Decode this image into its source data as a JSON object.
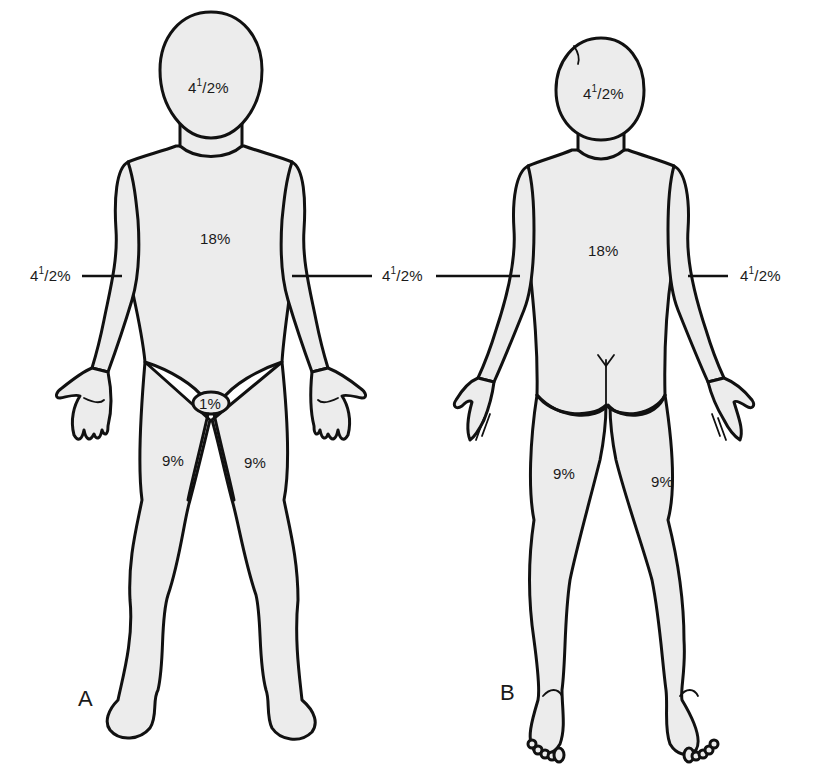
{
  "figure": {
    "fill_color": "#ececec",
    "outline_color": "#111111"
  },
  "panels": {
    "A": {
      "letter": "A",
      "view": "anterior",
      "labels": {
        "head": {
          "whole": "4",
          "sup": "1",
          "rest": "/2%"
        },
        "trunk": "18%",
        "left_arm": {
          "whole": "4",
          "sup": "1",
          "rest": "/2%"
        },
        "right_arm": {
          "whole": "4",
          "sup": "1",
          "rest": "/2%"
        },
        "genitalia": "1%",
        "left_leg": "9%",
        "right_leg": "9%"
      }
    },
    "B": {
      "letter": "B",
      "view": "posterior",
      "labels": {
        "head": {
          "whole": "4",
          "sup": "1",
          "rest": "/2%"
        },
        "trunk": "18%",
        "left_arm": {
          "whole": "4",
          "sup": "1",
          "rest": "/2%"
        },
        "right_arm": {
          "whole": "4",
          "sup": "1",
          "rest": "/2%"
        },
        "left_leg": "9%",
        "right_leg": "9%"
      }
    }
  }
}
